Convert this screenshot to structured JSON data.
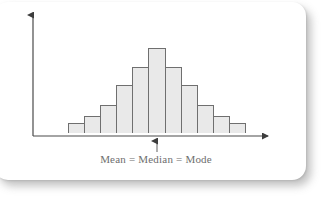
{
  "figure": {
    "caption": "Mean = Median = Mode",
    "pointer_icon": "up-arrow-icon",
    "x_axis_icon": "right-arrow-axis-icon",
    "y_axis_icon": "up-arrow-axis-icon",
    "colors": {
      "bar_fill": "#e9e9e9",
      "bar_stroke": "#6f6f6f",
      "axis": "#4a4a4a",
      "caption_text": "#6e6e6e",
      "card_background": "#ffffff",
      "page_background": "#ffffff"
    }
  },
  "chart_data": {
    "type": "bar",
    "title": "",
    "subtitle": "",
    "xlabel": "",
    "ylabel": "",
    "categories": [
      "1",
      "2",
      "3",
      "4",
      "5",
      "6",
      "7",
      "8",
      "9",
      "10",
      "11"
    ],
    "values": [
      11,
      18,
      29,
      51,
      70,
      90,
      70,
      51,
      29,
      18,
      11
    ],
    "ylim": [
      0,
      100
    ],
    "grid": false,
    "legend": null,
    "annotations": [
      {
        "text": "Mean = Median = Mode",
        "points_to_category": "6",
        "position": "below-axis-center",
        "marker": "up-arrow"
      }
    ]
  }
}
